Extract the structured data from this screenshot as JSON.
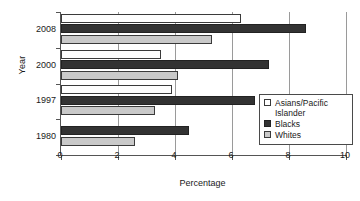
{
  "chart_data": {
    "type": "bar",
    "orientation": "horizontal",
    "title": "",
    "xlabel": "Percentage",
    "ylabel": "Year",
    "xlim": [
      0,
      10
    ],
    "xticks": [
      0,
      2,
      4,
      6,
      8,
      10
    ],
    "xtick_labels": [
      "0",
      "2",
      "4",
      "6",
      "8",
      "10"
    ],
    "categories": [
      "2008",
      "2000",
      "1997",
      "1980"
    ],
    "grid": "vertical",
    "legend_position": "center-right",
    "series": [
      {
        "name": "Asians/Pacific Islander",
        "color": "#ffffff",
        "values": [
          6.3,
          3.5,
          3.9,
          null
        ]
      },
      {
        "name": "Blacks",
        "color": "#333333",
        "values": [
          8.6,
          7.3,
          6.8,
          4.5
        ]
      },
      {
        "name": "Whites",
        "color": "#c9c9c9",
        "values": [
          5.3,
          4.1,
          3.3,
          2.6
        ]
      }
    ]
  },
  "axes": {
    "x_title": "Percentage",
    "y_title": "Year"
  },
  "legend": {
    "items": [
      {
        "label": "Asians/Pacific Islander",
        "swatch": "series-asian"
      },
      {
        "label": "Blacks",
        "swatch": "series-black"
      },
      {
        "label": "Whites",
        "swatch": "series-white"
      }
    ]
  }
}
